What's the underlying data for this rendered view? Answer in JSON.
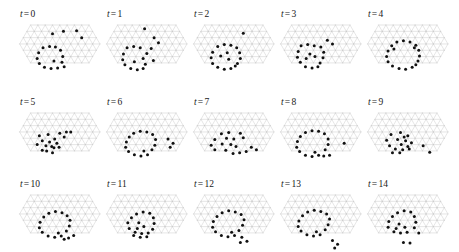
{
  "figure": {
    "type": "multi-panel-lattice-time-series",
    "rows": 3,
    "columns": 5,
    "panel_count": 15,
    "background_color": "#ffffff",
    "lattice_color": "#c8c8c8",
    "dot_color": "#111111",
    "label_color": "#1a1a1a",
    "label_variable": "t",
    "label_equals": "=",
    "dot_radius_px": 1.5,
    "lattice": {
      "type": "triangular",
      "rows": 7,
      "cols": 13,
      "spacing_x": 7.3,
      "spacing_y": 6.32,
      "origin_x": 2.0,
      "origin_y": 4.0,
      "hex_trim": true
    }
  },
  "panels": [
    {
      "index": 0,
      "label_var": "t",
      "label_eq": "=",
      "label_num": "0",
      "dot_count": 18,
      "dots": [
        [
          5.0,
          2.0
        ],
        [
          6.5,
          1.6
        ],
        [
          8.3,
          1.5
        ],
        [
          9.0,
          2.6
        ],
        [
          3.7,
          4.2
        ],
        [
          4.6,
          4.0
        ],
        [
          5.4,
          4.1
        ],
        [
          3.1,
          5.0
        ],
        [
          6.1,
          4.6
        ],
        [
          2.9,
          5.9
        ],
        [
          6.4,
          5.6
        ],
        [
          3.2,
          6.7
        ],
        [
          6.3,
          6.5
        ],
        [
          3.9,
          7.3
        ],
        [
          4.8,
          7.5
        ],
        [
          5.7,
          7.4
        ],
        [
          6.6,
          7.2
        ],
        [
          5.2,
          6.3
        ]
      ]
    },
    {
      "index": 1,
      "label_var": "t",
      "label_eq": "=",
      "label_num": "1",
      "dot_count": 18,
      "dots": [
        [
          5.7,
          1.2
        ],
        [
          7.0,
          2.6
        ],
        [
          7.6,
          3.4
        ],
        [
          3.3,
          4.2
        ],
        [
          4.2,
          4.0
        ],
        [
          5.1,
          4.2
        ],
        [
          6.6,
          4.3
        ],
        [
          2.8,
          5.2
        ],
        [
          6.0,
          5.1
        ],
        [
          2.7,
          6.1
        ],
        [
          5.5,
          5.9
        ],
        [
          3.0,
          6.9
        ],
        [
          5.8,
          6.8
        ],
        [
          3.8,
          7.5
        ],
        [
          4.7,
          7.7
        ],
        [
          5.5,
          7.5
        ],
        [
          6.9,
          6.2
        ],
        [
          4.3,
          6.4
        ]
      ]
    },
    {
      "index": 2,
      "label_var": "t",
      "label_eq": "=",
      "label_num": "2",
      "dot_count": 18,
      "dots": [
        [
          7.3,
          1.9
        ],
        [
          3.8,
          4.0
        ],
        [
          4.7,
          3.7
        ],
        [
          5.6,
          3.8
        ],
        [
          6.4,
          4.2
        ],
        [
          3.1,
          4.9
        ],
        [
          6.8,
          5.0
        ],
        [
          2.9,
          5.8
        ],
        [
          6.9,
          5.9
        ],
        [
          3.1,
          6.7
        ],
        [
          6.5,
          6.7
        ],
        [
          3.8,
          7.3
        ],
        [
          4.7,
          7.6
        ],
        [
          5.6,
          7.5
        ],
        [
          6.2,
          7.1
        ],
        [
          5.1,
          5.0
        ],
        [
          5.3,
          6.0
        ],
        [
          4.2,
          5.5
        ]
      ]
    },
    {
      "index": 3,
      "label_var": "t",
      "label_eq": "=",
      "label_num": "3",
      "dot_count": 18,
      "dots": [
        [
          6.9,
          3.0
        ],
        [
          7.6,
          3.6
        ],
        [
          3.3,
          3.9
        ],
        [
          4.2,
          3.7
        ],
        [
          5.1,
          3.9
        ],
        [
          6.0,
          4.1
        ],
        [
          2.9,
          4.8
        ],
        [
          6.4,
          4.9
        ],
        [
          2.8,
          5.7
        ],
        [
          6.3,
          5.8
        ],
        [
          3.2,
          6.5
        ],
        [
          5.9,
          6.6
        ],
        [
          3.9,
          7.2
        ],
        [
          4.8,
          7.4
        ],
        [
          5.6,
          7.2
        ],
        [
          4.5,
          5.2
        ],
        [
          5.2,
          5.6
        ],
        [
          4.0,
          5.9
        ]
      ]
    },
    {
      "index": 4,
      "label_var": "t",
      "label_eq": "=",
      "label_num": "4",
      "dot_count": 18,
      "dots": [
        [
          4.5,
          3.3
        ],
        [
          5.4,
          3.1
        ],
        [
          6.3,
          3.3
        ],
        [
          7.1,
          3.8
        ],
        [
          3.8,
          3.9
        ],
        [
          3.3,
          4.7
        ],
        [
          7.5,
          4.6
        ],
        [
          3.1,
          5.6
        ],
        [
          7.6,
          5.5
        ],
        [
          3.3,
          6.4
        ],
        [
          7.4,
          6.3
        ],
        [
          3.9,
          7.1
        ],
        [
          4.8,
          7.5
        ],
        [
          5.7,
          7.6
        ],
        [
          6.6,
          7.3
        ],
        [
          7.1,
          6.9
        ],
        [
          4.1,
          4.4
        ],
        [
          6.9,
          4.2
        ]
      ]
    },
    {
      "index": 5,
      "label_var": "t",
      "label_eq": "=",
      "label_num": "5",
      "dot_count": 18,
      "dots": [
        [
          3.2,
          4.2
        ],
        [
          4.4,
          4.0
        ],
        [
          6.0,
          3.8
        ],
        [
          6.9,
          3.6
        ],
        [
          7.5,
          3.6
        ],
        [
          3.6,
          5.0
        ],
        [
          5.3,
          4.7
        ],
        [
          5.6,
          5.4
        ],
        [
          2.9,
          5.6
        ],
        [
          4.1,
          5.8
        ],
        [
          5.2,
          6.1
        ],
        [
          3.6,
          6.5
        ],
        [
          5.0,
          6.9
        ],
        [
          5.9,
          6.0
        ],
        [
          4.6,
          5.2
        ],
        [
          6.6,
          4.4
        ],
        [
          4.9,
          5.9
        ],
        [
          4.2,
          6.6
        ]
      ]
    },
    {
      "index": 6,
      "label_var": "t",
      "label_eq": "=",
      "label_num": "6",
      "dot_count": 18,
      "dots": [
        [
          4.2,
          3.8
        ],
        [
          5.1,
          3.5
        ],
        [
          6.0,
          3.6
        ],
        [
          6.8,
          4.0
        ],
        [
          3.6,
          4.4
        ],
        [
          3.2,
          5.2
        ],
        [
          7.2,
          4.8
        ],
        [
          3.1,
          6.0
        ],
        [
          7.1,
          5.7
        ],
        [
          3.5,
          6.7
        ],
        [
          6.7,
          6.4
        ],
        [
          4.3,
          7.2
        ],
        [
          5.2,
          7.4
        ],
        [
          6.1,
          7.2
        ],
        [
          8.9,
          4.7
        ],
        [
          9.6,
          5.4
        ],
        [
          9.2,
          6.0
        ],
        [
          5.6,
          6.6
        ]
      ]
    },
    {
      "index": 7,
      "label_var": "t",
      "label_eq": "=",
      "label_num": "7",
      "dot_count": 18,
      "dots": [
        [
          4.3,
          3.9
        ],
        [
          5.3,
          3.7
        ],
        [
          6.9,
          3.8
        ],
        [
          3.4,
          4.8
        ],
        [
          5.0,
          4.6
        ],
        [
          6.0,
          4.7
        ],
        [
          7.3,
          4.5
        ],
        [
          2.9,
          5.7
        ],
        [
          4.4,
          5.5
        ],
        [
          5.6,
          5.6
        ],
        [
          3.4,
          6.4
        ],
        [
          4.9,
          6.5
        ],
        [
          8.4,
          6.0
        ],
        [
          9.1,
          6.4
        ],
        [
          5.9,
          7.0
        ],
        [
          6.8,
          6.9
        ],
        [
          7.7,
          6.7
        ],
        [
          6.3,
          5.9
        ]
      ]
    },
    {
      "index": 8,
      "label_var": "t",
      "label_eq": "=",
      "label_num": "8",
      "dot_count": 18,
      "dots": [
        [
          3.9,
          3.7
        ],
        [
          4.8,
          3.4
        ],
        [
          5.7,
          3.5
        ],
        [
          6.5,
          3.9
        ],
        [
          3.2,
          4.3
        ],
        [
          2.8,
          5.1
        ],
        [
          7.0,
          4.7
        ],
        [
          2.7,
          6.0
        ],
        [
          7.0,
          5.6
        ],
        [
          3.1,
          6.7
        ],
        [
          6.6,
          6.4
        ],
        [
          3.9,
          7.3
        ],
        [
          4.8,
          7.5
        ],
        [
          5.7,
          7.3
        ],
        [
          6.4,
          7.4
        ],
        [
          7.2,
          7.3
        ],
        [
          9.2,
          5.4
        ],
        [
          5.2,
          6.8
        ]
      ]
    },
    {
      "index": 9,
      "label_var": "t",
      "label_eq": "=",
      "label_num": "9",
      "dot_count": 18,
      "dots": [
        [
          3.7,
          4.0
        ],
        [
          5.0,
          3.7
        ],
        [
          6.0,
          4.2
        ],
        [
          3.1,
          4.9
        ],
        [
          4.6,
          4.8
        ],
        [
          5.7,
          5.0
        ],
        [
          6.5,
          5.3
        ],
        [
          3.5,
          5.8
        ],
        [
          5.1,
          5.6
        ],
        [
          6.0,
          5.9
        ],
        [
          4.3,
          6.3
        ],
        [
          5.3,
          6.4
        ],
        [
          6.2,
          6.3
        ],
        [
          3.9,
          6.9
        ],
        [
          8.1,
          5.8
        ],
        [
          9.0,
          6.8
        ],
        [
          5.5,
          4.4
        ],
        [
          4.9,
          6.9
        ]
      ]
    },
    {
      "index": 10,
      "label_var": "t",
      "label_eq": "=",
      "label_num": "10",
      "dot_count": 18,
      "dots": [
        [
          4.5,
          3.5
        ],
        [
          5.4,
          3.2
        ],
        [
          6.3,
          3.4
        ],
        [
          7.0,
          3.9
        ],
        [
          3.8,
          4.1
        ],
        [
          3.3,
          4.9
        ],
        [
          7.4,
          4.6
        ],
        [
          3.2,
          5.8
        ],
        [
          7.3,
          5.5
        ],
        [
          3.6,
          6.5
        ],
        [
          6.9,
          6.3
        ],
        [
          4.4,
          7.1
        ],
        [
          5.3,
          7.3
        ],
        [
          6.2,
          7.1
        ],
        [
          7.2,
          7.4
        ],
        [
          7.9,
          7.0
        ],
        [
          6.6,
          7.6
        ],
        [
          5.8,
          6.6
        ]
      ]
    },
    {
      "index": 11,
      "label_var": "t",
      "label_eq": "=",
      "label_num": "11",
      "dot_count": 18,
      "dots": [
        [
          4.6,
          3.6
        ],
        [
          5.5,
          3.3
        ],
        [
          6.4,
          3.5
        ],
        [
          3.9,
          4.2
        ],
        [
          3.4,
          5.0
        ],
        [
          6.9,
          4.2
        ],
        [
          3.6,
          5.9
        ],
        [
          7.0,
          5.1
        ],
        [
          6.8,
          6.0
        ],
        [
          4.4,
          6.5
        ],
        [
          5.3,
          6.7
        ],
        [
          6.2,
          6.6
        ],
        [
          4.9,
          5.0
        ],
        [
          5.6,
          5.6
        ],
        [
          4.7,
          5.9
        ],
        [
          6.0,
          7.2
        ],
        [
          5.1,
          7.3
        ],
        [
          4.2,
          7.0
        ]
      ]
    },
    {
      "index": 12,
      "label_var": "t",
      "label_eq": "=",
      "label_num": "12",
      "dot_count": 18,
      "dots": [
        [
          4.4,
          3.4
        ],
        [
          5.3,
          3.1
        ],
        [
          6.2,
          3.3
        ],
        [
          7.0,
          3.7
        ],
        [
          3.7,
          4.0
        ],
        [
          3.2,
          4.8
        ],
        [
          7.4,
          4.5
        ],
        [
          3.1,
          5.7
        ],
        [
          7.2,
          5.4
        ],
        [
          3.5,
          6.4
        ],
        [
          6.7,
          6.2
        ],
        [
          4.3,
          7.0
        ],
        [
          5.2,
          7.2
        ],
        [
          6.1,
          7.0
        ],
        [
          7.1,
          7.3
        ],
        [
          7.8,
          7.9
        ],
        [
          6.9,
          8.1
        ],
        [
          5.7,
          6.5
        ]
      ]
    },
    {
      "index": 13,
      "label_var": "t",
      "label_eq": "=",
      "label_num": "13",
      "dot_count": 18,
      "dots": [
        [
          4.2,
          3.3
        ],
        [
          5.1,
          3.0
        ],
        [
          6.0,
          3.2
        ],
        [
          6.8,
          3.6
        ],
        [
          3.5,
          3.9
        ],
        [
          3.0,
          4.7
        ],
        [
          7.2,
          4.4
        ],
        [
          2.9,
          5.6
        ],
        [
          7.0,
          5.3
        ],
        [
          3.3,
          6.3
        ],
        [
          6.6,
          6.1
        ],
        [
          4.1,
          6.9
        ],
        [
          5.0,
          7.1
        ],
        [
          5.9,
          6.9
        ],
        [
          7.6,
          7.8
        ],
        [
          8.3,
          8.4
        ],
        [
          7.9,
          9.0
        ],
        [
          5.4,
          6.4
        ]
      ]
    },
    {
      "index": 14,
      "label_var": "t",
      "label_eq": "=",
      "label_num": "14",
      "dot_count": 18,
      "dots": [
        [
          4.6,
          3.4
        ],
        [
          5.5,
          3.1
        ],
        [
          6.4,
          3.3
        ],
        [
          3.9,
          4.0
        ],
        [
          3.4,
          4.8
        ],
        [
          6.9,
          4.0
        ],
        [
          3.3,
          5.7
        ],
        [
          7.1,
          4.9
        ],
        [
          6.9,
          5.8
        ],
        [
          4.1,
          6.4
        ],
        [
          5.0,
          6.6
        ],
        [
          5.9,
          6.5
        ],
        [
          7.5,
          6.6
        ],
        [
          5.4,
          8.1
        ],
        [
          6.3,
          8.2
        ],
        [
          4.8,
          5.2
        ],
        [
          5.6,
          5.7
        ],
        [
          4.4,
          5.9
        ]
      ]
    }
  ]
}
